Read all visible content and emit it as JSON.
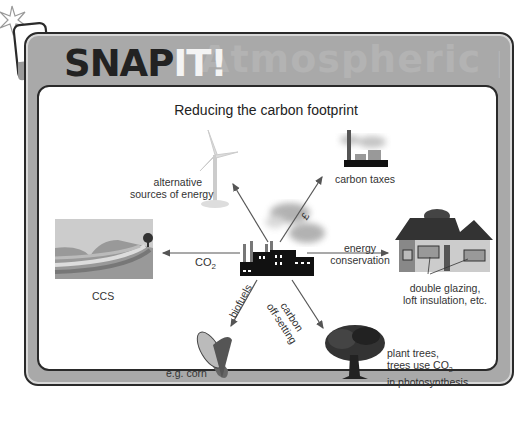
{
  "header": {
    "brand_prefix": "SNAP",
    "brand_highlight": "IT!",
    "ghost_text": "Atmospheric pollution"
  },
  "diagram": {
    "title": "Reducing the carbon footprint",
    "center": "factory emitting smoke",
    "branches": [
      {
        "id": "alternative-energy",
        "label_lines": [
          "alternative",
          "sources of energy"
        ],
        "image": "wind turbine"
      },
      {
        "id": "carbon-taxes",
        "label": "carbon taxes",
        "arrow_label": "£",
        "image": "power station"
      },
      {
        "id": "energy-conservation",
        "arrow_label_lines": [
          "energy",
          "conservation"
        ],
        "caption_lines": [
          "double glazing,",
          "loft insulation, etc."
        ],
        "image": "house"
      },
      {
        "id": "carbon-offsetting",
        "arrow_label_lines": [
          "carbon",
          "off-setting"
        ],
        "caption_lines": [
          "plant trees,",
          "trees use CO",
          "in photosynthesis"
        ],
        "caption_sub": "2",
        "image": "tree"
      },
      {
        "id": "biofuels",
        "arrow_label": "biofuels",
        "caption": "e.g. corn",
        "image": "corn"
      },
      {
        "id": "ccs",
        "arrow_label": "CO",
        "arrow_label_sub": "2",
        "caption": "CCS",
        "image": "geological layers"
      }
    ]
  },
  "colors": {
    "frame": "#a9a9a9",
    "outline": "#2a2a2a",
    "arrow": "#555555"
  }
}
